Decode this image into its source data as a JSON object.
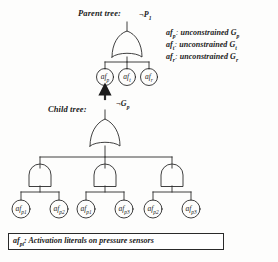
{
  "figure": {
    "type": "fault-tree-diagram",
    "background_color": "#fdfdfc",
    "line_color": "#2a2a2a"
  },
  "parent_tree": {
    "section_label": "Parent tree:",
    "root_label": "¬P",
    "root_label_sub": "1",
    "gate": {
      "name": "or-gate",
      "type": "OR"
    },
    "leaves": [
      {
        "text": "af",
        "sub": "p"
      },
      {
        "text": "af",
        "sub": "t"
      },
      {
        "text": "af",
        "sub": "r"
      }
    ]
  },
  "legend": {
    "lines": [
      {
        "term": "af",
        "term_sub": "p",
        "desc": "unconstrained",
        "gsym": "G",
        "gsym_sub": "p"
      },
      {
        "term": "af",
        "term_sub": "t",
        "desc": "unconstrained",
        "gsym": "G",
        "gsym_sub": "t"
      },
      {
        "term": "af",
        "term_sub": "r",
        "desc": "unconstrained",
        "gsym": "G",
        "gsym_sub": "r"
      }
    ]
  },
  "link": {
    "arrow_name": "upward-arrow",
    "from_label": "¬G",
    "from_label_sub": "p"
  },
  "child_tree": {
    "section_label": "Child tree:",
    "root_label": "¬G",
    "root_label_sub": "p",
    "gate": {
      "name": "or-gate",
      "type": "OR"
    },
    "and_gates": [
      {
        "name": "and-gate-left",
        "type": "AND"
      },
      {
        "name": "and-gate-middle",
        "type": "AND"
      },
      {
        "name": "and-gate-right",
        "type": "AND"
      }
    ],
    "leaves": [
      {
        "text": "af",
        "sub": "p1"
      },
      {
        "text": "af",
        "sub": "p2"
      },
      {
        "text": "af",
        "sub": "p1"
      },
      {
        "text": "af",
        "sub": "p3"
      },
      {
        "text": "af",
        "sub": "p2"
      },
      {
        "text": "af",
        "sub": "p3"
      }
    ]
  },
  "caption": {
    "term": "af",
    "term_sub": "pi",
    "text": ": Activation literals on pressure sensors"
  }
}
